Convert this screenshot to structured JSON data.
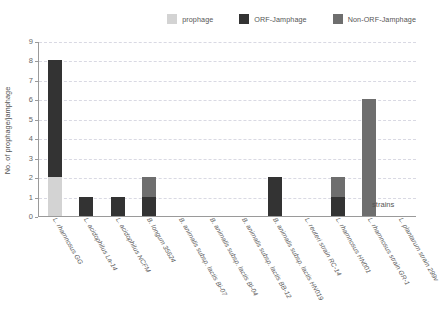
{
  "legend": {
    "items": [
      {
        "label": "prophage",
        "color": "#d3d3d3",
        "name": "legend-prophage"
      },
      {
        "label": "ORF-Jamphage",
        "color": "#333333",
        "name": "legend-orf-jamphage"
      },
      {
        "label": "Non-ORF-Jamphage",
        "color": "#6e6e6e",
        "name": "legend-non-orf-jamphage"
      }
    ]
  },
  "chart_data": {
    "type": "bar",
    "stacked": true,
    "title": "",
    "xlabel": "strains",
    "ylabel": "No. of prophage/jamphage",
    "ylim": [
      0,
      9
    ],
    "yticks": [
      0,
      1,
      2,
      3,
      4,
      5,
      6,
      7,
      8,
      9
    ],
    "grid": true,
    "legend_position": "top-right",
    "categories": [
      "L. rhamnosus GG",
      "L. acidophilus La-14",
      "L. acidophilus NCFM",
      "B. longum 35624",
      "B. animalis subsp. lactis Bi-07",
      "B. animalis subsp. lactis Bl-04",
      "B. animalis subsp. lactis BB-12",
      "B. animalis subsp. lactis HN019",
      "L. reuteri strain RC-14",
      "L. rhamnosus HN001",
      "L. rhamnosus strain GR-1",
      "L. plantarum strain 299v"
    ],
    "series": [
      {
        "name": "prophage",
        "color": "#d3d3d3",
        "values": [
          2,
          0,
          0,
          0,
          0,
          0,
          0,
          0,
          0,
          0,
          0,
          0
        ]
      },
      {
        "name": "ORF-Jamphage",
        "color": "#333333",
        "values": [
          6,
          1,
          1,
          1,
          0,
          0,
          0,
          2,
          0,
          1,
          0,
          0
        ]
      },
      {
        "name": "Non-ORF-Jamphage",
        "color": "#6e6e6e",
        "values": [
          0,
          0,
          0,
          1,
          0,
          0,
          0,
          0,
          0,
          1,
          6,
          0
        ]
      }
    ],
    "totals": [
      8,
      1,
      1,
      2,
      0,
      0,
      0,
      2,
      0,
      2,
      6,
      0
    ]
  }
}
